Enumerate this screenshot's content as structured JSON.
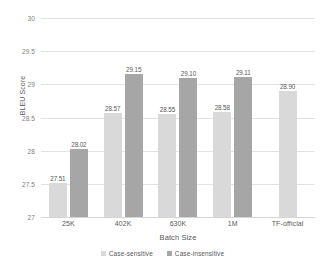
{
  "chart_data": {
    "type": "bar",
    "title": "",
    "xlabel": "Batch Size",
    "ylabel": "BLEU Score",
    "categories": [
      "25K",
      "402K",
      "630K",
      "1M",
      "TF-official"
    ],
    "ylim": [
      27,
      30
    ],
    "yticks": [
      27,
      27.5,
      28,
      28.5,
      29,
      29.5,
      30
    ],
    "ytick_labels": [
      "27",
      "27.5",
      "28",
      "28.5",
      "29",
      "29.5",
      "30"
    ],
    "grid": true,
    "legend_position": "bottom",
    "series": [
      {
        "name": "Case-sensitive",
        "color": "#d9d9d9",
        "values": [
          27.51,
          28.57,
          28.55,
          28.58,
          28.9
        ],
        "value_labels": [
          "27.51",
          "28.57",
          "28.55",
          "28.58",
          "28.90"
        ]
      },
      {
        "name": "Case-insensitive",
        "color": "#a6a6a6",
        "values": [
          28.02,
          29.15,
          29.1,
          29.11,
          null
        ],
        "value_labels": [
          "28.02",
          "29.15",
          "29.10",
          "29.11",
          ""
        ]
      }
    ]
  },
  "legend": {
    "items": [
      {
        "label": "Case-sensitive",
        "color": "#d9d9d9"
      },
      {
        "label": "Case-insensitive",
        "color": "#a6a6a6"
      }
    ]
  },
  "axes": {
    "y_title": "BLEU Score",
    "x_title": "Batch Size"
  },
  "colors": {
    "series_light": "#d9d9d9",
    "series_dark": "#a6a6a6",
    "gridline": "#e2e2e2",
    "text": "#595959",
    "tick_text": "#808080",
    "background": "#ffffff"
  }
}
